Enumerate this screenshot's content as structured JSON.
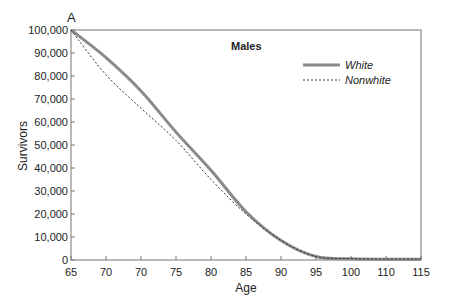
{
  "panel_label": "A",
  "chart_data": {
    "type": "line",
    "title": "Males",
    "xlabel": "Age",
    "ylabel": "Survivors",
    "x_tick_labels": [
      "65",
      "70",
      "70",
      "75",
      "80",
      "85",
      "90",
      "95",
      "100",
      "110",
      "115"
    ],
    "y_tick_labels": [
      "0",
      "10,000",
      "20,000",
      "30,000",
      "40,000",
      "50,000",
      "60,000",
      "70,000",
      "80,000",
      "90,000",
      "100,000"
    ],
    "ylim": [
      0,
      100000
    ],
    "grid": false,
    "legend_position": "upper right",
    "series": [
      {
        "name": "White",
        "style": "solid",
        "color": "#8a8a8a",
        "values": [
          100000,
          88000,
          73500,
          55600,
          39000,
          21000,
          8500,
          1500,
          500,
          300,
          300
        ]
      },
      {
        "name": "Nonwhite",
        "style": "dashed",
        "color": "#333333",
        "values": [
          100000,
          80500,
          66000,
          52000,
          35000,
          20000,
          8500,
          1500,
          600,
          400,
          400
        ]
      }
    ]
  }
}
